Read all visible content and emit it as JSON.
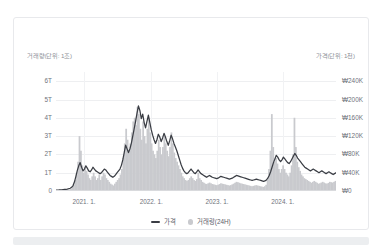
{
  "card": {
    "left_unit_caption": "거래량(단위: 1조)",
    "right_unit_caption": "가격(단위: 1천)"
  },
  "legend": {
    "price": {
      "label": "가격",
      "marker": "line-marker",
      "color": "#3a3d44"
    },
    "volume": {
      "label": "거래량(24H)",
      "marker": "dot-marker",
      "color": "#c9cace"
    }
  },
  "chart_data": {
    "type": "line",
    "title": "",
    "subtitle": "",
    "xlabel": "",
    "ylabel": "거래량(단위: 1조)",
    "y2label": "가격(단위: 1천)",
    "grid": true,
    "legend_position": "bottom-center",
    "x_tick_labels": [
      "2021. 1.",
      "2022. 1.",
      "2023. 1.",
      "2024. 1."
    ],
    "x_tick_fractions": [
      0.1,
      0.34,
      0.575,
      0.81
    ],
    "x_range_start": "2020. 9.",
    "x_range_end": "2024. 10.",
    "yaxis_left": {
      "tick_labels": [
        "6T",
        "5T",
        "4T",
        "3T",
        "2T",
        "1T",
        "0"
      ],
      "tick_values": [
        6,
        5,
        4,
        3,
        2,
        1,
        0
      ],
      "min": 0,
      "max": 6.5,
      "unit": "조 (trillion KRW)"
    },
    "yaxis_right": {
      "tick_labels": [
        "₩240K",
        "₩200K",
        "₩160K",
        "₩120K",
        "₩80K",
        "₩40K",
        "₩0"
      ],
      "tick_values": [
        240000,
        200000,
        160000,
        120000,
        80000,
        40000,
        0
      ],
      "min": 0,
      "max": 260000,
      "unit": "원 (KRW)"
    },
    "series": [
      {
        "name": "가격",
        "type": "line",
        "axis": "right",
        "color": "#3a3d44",
        "values": [
          2000,
          2100,
          2200,
          2400,
          2600,
          3000,
          3400,
          3800,
          4200,
          5000,
          6000,
          8000,
          12000,
          20000,
          32000,
          45000,
          55000,
          62000,
          52000,
          44000,
          48000,
          55000,
          50000,
          44000,
          42000,
          46000,
          52000,
          48000,
          44000,
          42000,
          40000,
          38000,
          40000,
          44000,
          48000,
          46000,
          42000,
          38000,
          34000,
          32000,
          30000,
          32000,
          36000,
          40000,
          44000,
          48000,
          56000,
          68000,
          84000,
          100000,
          92000,
          84000,
          92000,
          104000,
          120000,
          136000,
          152000,
          170000,
          186000,
          176000,
          158000,
          168000,
          150000,
          138000,
          152000,
          166000,
          150000,
          134000,
          122000,
          112000,
          104000,
          112000,
          124000,
          118000,
          108000,
          116000,
          126000,
          118000,
          108000,
          100000,
          110000,
          122000,
          114000,
          104000,
          96000,
          88000,
          78000,
          68000,
          58000,
          50000,
          44000,
          40000,
          38000,
          40000,
          44000,
          48000,
          44000,
          40000,
          38000,
          42000,
          46000,
          42000,
          38000,
          36000,
          34000,
          32000,
          30000,
          32000,
          34000,
          32000,
          30000,
          29000,
          28000,
          27000,
          28000,
          30000,
          32000,
          31000,
          30000,
          29000,
          28000,
          27000,
          26000,
          27000,
          28000,
          30000,
          32000,
          34000,
          33000,
          32000,
          31000,
          30000,
          29000,
          28000,
          27000,
          26000,
          25000,
          24000,
          23000,
          24000,
          25000,
          26000,
          25000,
          24000,
          23000,
          22000,
          21000,
          22000,
          24000,
          28000,
          34000,
          42000,
          52000,
          62000,
          70000,
          78000,
          74000,
          68000,
          64000,
          68000,
          74000,
          70000,
          66000,
          62000,
          60000,
          64000,
          70000,
          76000,
          82000,
          78000,
          72000,
          68000,
          64000,
          60000,
          56000,
          52000,
          50000,
          48000,
          46000,
          44000,
          46000,
          48000,
          46000,
          44000,
          42000,
          40000,
          42000,
          44000,
          42000,
          40000,
          38000,
          40000,
          42000,
          40000,
          38000,
          36000,
          38000,
          40000
        ]
      },
      {
        "name": "거래량(24H)",
        "type": "bar",
        "axis": "left",
        "color": "#c9cace",
        "values": [
          0.02,
          0.03,
          0.02,
          0.04,
          0.03,
          0.05,
          0.04,
          0.06,
          0.05,
          0.08,
          0.12,
          0.2,
          0.35,
          0.6,
          1.0,
          1.6,
          3.0,
          2.2,
          1.4,
          1.0,
          1.3,
          1.1,
          0.9,
          0.7,
          0.6,
          0.8,
          1.0,
          0.8,
          0.6,
          0.7,
          0.9,
          0.6,
          0.8,
          1.0,
          0.9,
          0.7,
          0.6,
          0.5,
          0.4,
          0.35,
          0.3,
          0.4,
          0.5,
          0.6,
          0.7,
          0.9,
          1.2,
          1.8,
          2.6,
          3.4,
          2.8,
          2.2,
          2.6,
          3.2,
          3.8,
          4.0,
          3.6,
          4.6,
          4.2,
          3.4,
          2.8,
          3.8,
          3.0,
          2.6,
          3.4,
          4.0,
          3.2,
          2.6,
          2.2,
          2.0,
          1.8,
          2.2,
          2.8,
          2.4,
          2.0,
          2.4,
          3.0,
          2.6,
          2.2,
          1.9,
          2.4,
          3.2,
          2.6,
          2.1,
          1.8,
          1.6,
          1.4,
          1.2,
          1.0,
          0.8,
          0.7,
          0.6,
          0.55,
          0.6,
          0.7,
          0.8,
          0.7,
          0.6,
          0.55,
          0.65,
          1.0,
          0.7,
          0.6,
          0.5,
          0.45,
          0.4,
          0.38,
          0.42,
          0.46,
          0.42,
          0.38,
          0.36,
          0.34,
          0.32,
          0.34,
          0.38,
          0.42,
          0.4,
          0.38,
          0.36,
          0.34,
          0.32,
          0.3,
          0.32,
          0.36,
          0.4,
          0.45,
          0.5,
          0.48,
          0.45,
          0.42,
          0.4,
          0.38,
          0.36,
          0.34,
          0.32,
          0.3,
          0.28,
          0.26,
          0.28,
          0.3,
          0.32,
          0.3,
          0.28,
          0.26,
          0.24,
          0.22,
          0.26,
          0.34,
          0.6,
          1.2,
          2.2,
          4.2,
          2.4,
          1.6,
          1.8,
          1.5,
          1.2,
          1.0,
          1.2,
          1.4,
          1.2,
          1.0,
          0.9,
          0.8,
          1.0,
          1.4,
          2.0,
          4.0,
          2.4,
          1.6,
          1.3,
          1.1,
          0.9,
          0.8,
          0.7,
          0.65,
          0.6,
          0.55,
          0.5,
          0.45,
          0.5,
          0.55,
          0.5,
          0.45,
          0.4,
          0.42,
          0.46,
          0.5,
          0.46,
          0.42,
          0.4,
          0.44,
          0.5,
          0.48,
          0.46,
          0.5,
          0.55
        ]
      }
    ]
  }
}
